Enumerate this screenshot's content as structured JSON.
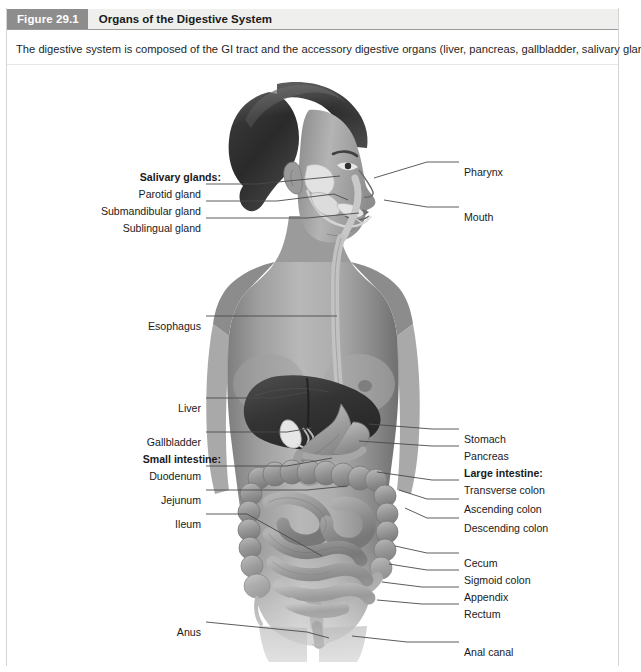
{
  "header": {
    "figure_number": "Figure 29.1",
    "title": "Organs of the Digestive System"
  },
  "caption": "The digestive system is composed of the GI tract and the accessory digestive organs (liver, pancreas, gallbladder, salivary glands).",
  "colors": {
    "badge_bg": "#8d8d8d",
    "badge_text": "#ffffff",
    "title_bg": "#efefed",
    "title_text": "#1a1a1a",
    "rule": "#9a9a9a",
    "leader_line": "#4a4a4a",
    "page_bg": "#ffffff"
  },
  "illustration": {
    "name": "digestive-system-anatomy-illustration",
    "description": "Grayscale anatomical illustration of a woman shown in anterior view with the digestive tract visible"
  },
  "labels": {
    "left": [
      {
        "id": "salivary-glands",
        "text": "Salivary glands:",
        "bold": true,
        "x": 214,
        "y": 105,
        "leader": null
      },
      {
        "id": "parotid-gland",
        "text": "Parotid gland",
        "bold": false,
        "x": 194,
        "y": 122,
        "leader": [
          [
            199,
            118
          ],
          [
            250,
            118
          ],
          [
            333,
            110
          ]
        ]
      },
      {
        "id": "submandibular-gland",
        "text": "Submandibular gland",
        "bold": false,
        "x": 194,
        "y": 139,
        "leader": [
          [
            199,
            135
          ],
          [
            270,
            135
          ],
          [
            327,
            128
          ],
          [
            341,
            134
          ]
        ]
      },
      {
        "id": "sublingual-gland",
        "text": "Sublingual gland",
        "bold": false,
        "x": 194,
        "y": 156,
        "leader": [
          [
            199,
            152
          ],
          [
            300,
            152
          ],
          [
            352,
            147
          ]
        ]
      },
      {
        "id": "esophagus",
        "text": "Esophagus",
        "bold": false,
        "x": 194,
        "y": 254,
        "leader": [
          [
            199,
            250
          ],
          [
            330,
            250
          ]
        ]
      },
      {
        "id": "liver",
        "text": "Liver",
        "bold": false,
        "x": 194,
        "y": 336,
        "leader": [
          [
            199,
            332
          ],
          [
            268,
            332
          ],
          [
            300,
            326
          ]
        ]
      },
      {
        "id": "gallbladder",
        "text": "Gallbladder",
        "bold": false,
        "x": 194,
        "y": 370,
        "leader": [
          [
            199,
            366
          ],
          [
            280,
            366
          ],
          [
            305,
            362
          ]
        ]
      },
      {
        "id": "small-intestine",
        "text": "Small intestine:",
        "bold": true,
        "x": 214,
        "y": 387,
        "leader": null
      },
      {
        "id": "duodenum",
        "text": "Duodenum",
        "bold": false,
        "x": 194,
        "y": 404,
        "leader": [
          [
            199,
            400
          ],
          [
            280,
            400
          ],
          [
            325,
            392
          ]
        ]
      },
      {
        "id": "jejunum",
        "text": "Jejunum",
        "bold": false,
        "x": 194,
        "y": 428,
        "leader": [
          [
            199,
            424
          ],
          [
            300,
            424
          ],
          [
            340,
            420
          ]
        ]
      },
      {
        "id": "ileum",
        "text": "Ileum",
        "bold": false,
        "x": 194,
        "y": 452,
        "leader": [
          [
            199,
            448
          ],
          [
            240,
            448
          ],
          [
            315,
            490
          ]
        ]
      },
      {
        "id": "anus",
        "text": "Anus",
        "bold": false,
        "x": 194,
        "y": 560,
        "leader": [
          [
            199,
            556
          ],
          [
            300,
            566
          ],
          [
            322,
            572
          ]
        ]
      }
    ],
    "right": [
      {
        "id": "pharynx",
        "text": "Pharynx",
        "bold": false,
        "x": 457,
        "y": 100,
        "leader": [
          [
            452,
            96
          ],
          [
            420,
            96
          ],
          [
            367,
            112
          ]
        ]
      },
      {
        "id": "mouth",
        "text": "Mouth",
        "bold": false,
        "x": 457,
        "y": 145,
        "leader": [
          [
            452,
            141
          ],
          [
            420,
            141
          ],
          [
            377,
            134
          ]
        ]
      },
      {
        "id": "stomach",
        "text": "Stomach",
        "bold": false,
        "x": 457,
        "y": 367,
        "leader": [
          [
            452,
            363
          ],
          [
            425,
            363
          ],
          [
            362,
            358
          ]
        ]
      },
      {
        "id": "pancreas",
        "text": "Pancreas",
        "bold": false,
        "x": 457,
        "y": 384,
        "leader": [
          [
            452,
            380
          ],
          [
            425,
            380
          ],
          [
            352,
            375
          ]
        ]
      },
      {
        "id": "large-intestine",
        "text": "Large intestine:",
        "bold": true,
        "x": 457,
        "y": 401,
        "leader": null
      },
      {
        "id": "transverse-colon",
        "text": "Transverse colon",
        "bold": false,
        "x": 457,
        "y": 418,
        "leader": [
          [
            452,
            414
          ],
          [
            425,
            414
          ],
          [
            370,
            406
          ]
        ]
      },
      {
        "id": "ascending-colon",
        "text": "Ascending colon",
        "bold": false,
        "x": 457,
        "y": 437,
        "leader": [
          [
            452,
            433
          ],
          [
            420,
            433
          ],
          [
            392,
            424
          ]
        ]
      },
      {
        "id": "descending-colon",
        "text": "Descending colon",
        "bold": false,
        "x": 457,
        "y": 456,
        "leader": [
          [
            452,
            452
          ],
          [
            420,
            452
          ],
          [
            398,
            442
          ]
        ]
      },
      {
        "id": "cecum",
        "text": "Cecum",
        "bold": false,
        "x": 457,
        "y": 491,
        "leader": [
          [
            452,
            487
          ],
          [
            420,
            487
          ],
          [
            388,
            480
          ]
        ]
      },
      {
        "id": "sigmoid-colon",
        "text": "Sigmoid colon",
        "bold": false,
        "x": 457,
        "y": 508,
        "leader": [
          [
            452,
            504
          ],
          [
            420,
            504
          ],
          [
            382,
            498
          ]
        ]
      },
      {
        "id": "appendix",
        "text": "Appendix",
        "bold": false,
        "x": 457,
        "y": 525,
        "leader": [
          [
            452,
            521
          ],
          [
            415,
            521
          ],
          [
            375,
            516
          ]
        ]
      },
      {
        "id": "rectum",
        "text": "Rectum",
        "bold": false,
        "x": 457,
        "y": 542,
        "leader": [
          [
            452,
            538
          ],
          [
            415,
            538
          ],
          [
            370,
            534
          ]
        ]
      },
      {
        "id": "anal-canal",
        "text": "Anal canal",
        "bold": false,
        "x": 457,
        "y": 580,
        "leader": [
          [
            452,
            576
          ],
          [
            400,
            576
          ],
          [
            345,
            570
          ]
        ]
      }
    ]
  }
}
